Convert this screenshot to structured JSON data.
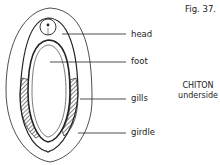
{
  "figure": {
    "number_label": "Fig. 37.",
    "title": "CHITON",
    "subtitle": "underside"
  },
  "labels": [
    {
      "id": "head",
      "text": "head"
    },
    {
      "id": "foot",
      "text": "foot"
    },
    {
      "id": "gills",
      "text": "gills"
    },
    {
      "id": "girdle",
      "text": "girdle"
    }
  ],
  "colors": {
    "ink": "#222222",
    "background": "#ffffff"
  }
}
